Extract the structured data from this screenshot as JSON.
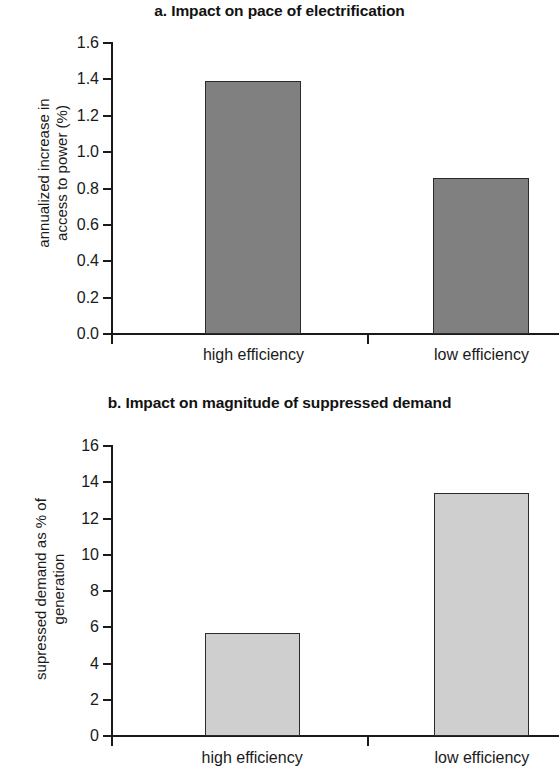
{
  "figure": {
    "background": "#ffffff"
  },
  "charts": [
    {
      "id": "a",
      "title": "a. Impact on pace of electrification",
      "ylabel": "annualized increase in\naccess to power (%)",
      "bar_color": "#808080",
      "bar_edge_color": "#2b2b2b",
      "ticks": [
        "0.0",
        "0.2",
        "0.4",
        "0.6",
        "0.8",
        "1.0",
        "1.2",
        "1.4",
        "1.6"
      ],
      "categories": [
        "high efficiency",
        "low efficiency"
      ],
      "values": [
        1.39,
        0.86
      ],
      "ymin": 0,
      "ymax": 1.6
    },
    {
      "id": "b",
      "title": "b. Impact on magnitude of suppressed demand",
      "ylabel": "supressed demand as % of\ngeneration",
      "bar_color": "#cfcfcf",
      "bar_edge_color": "#2b2b2b",
      "ticks": [
        "0",
        "2",
        "4",
        "6",
        "8",
        "10",
        "12",
        "14",
        "16"
      ],
      "categories": [
        "high efficiency",
        "low efficiency"
      ],
      "values": [
        5.7,
        13.4
      ],
      "ymin": 0,
      "ymax": 16
    }
  ],
  "chart_data": [
    {
      "type": "bar",
      "title": "a. Impact on pace of electrification",
      "categories": [
        "high efficiency",
        "low efficiency"
      ],
      "values": [
        1.39,
        0.86
      ],
      "xlabel": "",
      "ylabel": "annualized increase in access to power (%)",
      "ylim": [
        0.0,
        1.6
      ],
      "ytick_labels": [
        "0.0",
        "0.2",
        "0.4",
        "0.6",
        "0.8",
        "1.0",
        "1.2",
        "1.4",
        "1.6"
      ],
      "grid": false,
      "legend": "none",
      "bar_color": "#808080"
    },
    {
      "type": "bar",
      "title": "b. Impact on magnitude of suppressed demand",
      "categories": [
        "high efficiency",
        "low efficiency"
      ],
      "values": [
        5.7,
        13.4
      ],
      "xlabel": "",
      "ylabel": "supressed demand as % of generation",
      "ylim": [
        0,
        16
      ],
      "ytick_labels": [
        "0",
        "2",
        "4",
        "6",
        "8",
        "10",
        "12",
        "14",
        "16"
      ],
      "grid": false,
      "legend": "none",
      "bar_color": "#cfcfcf"
    }
  ]
}
